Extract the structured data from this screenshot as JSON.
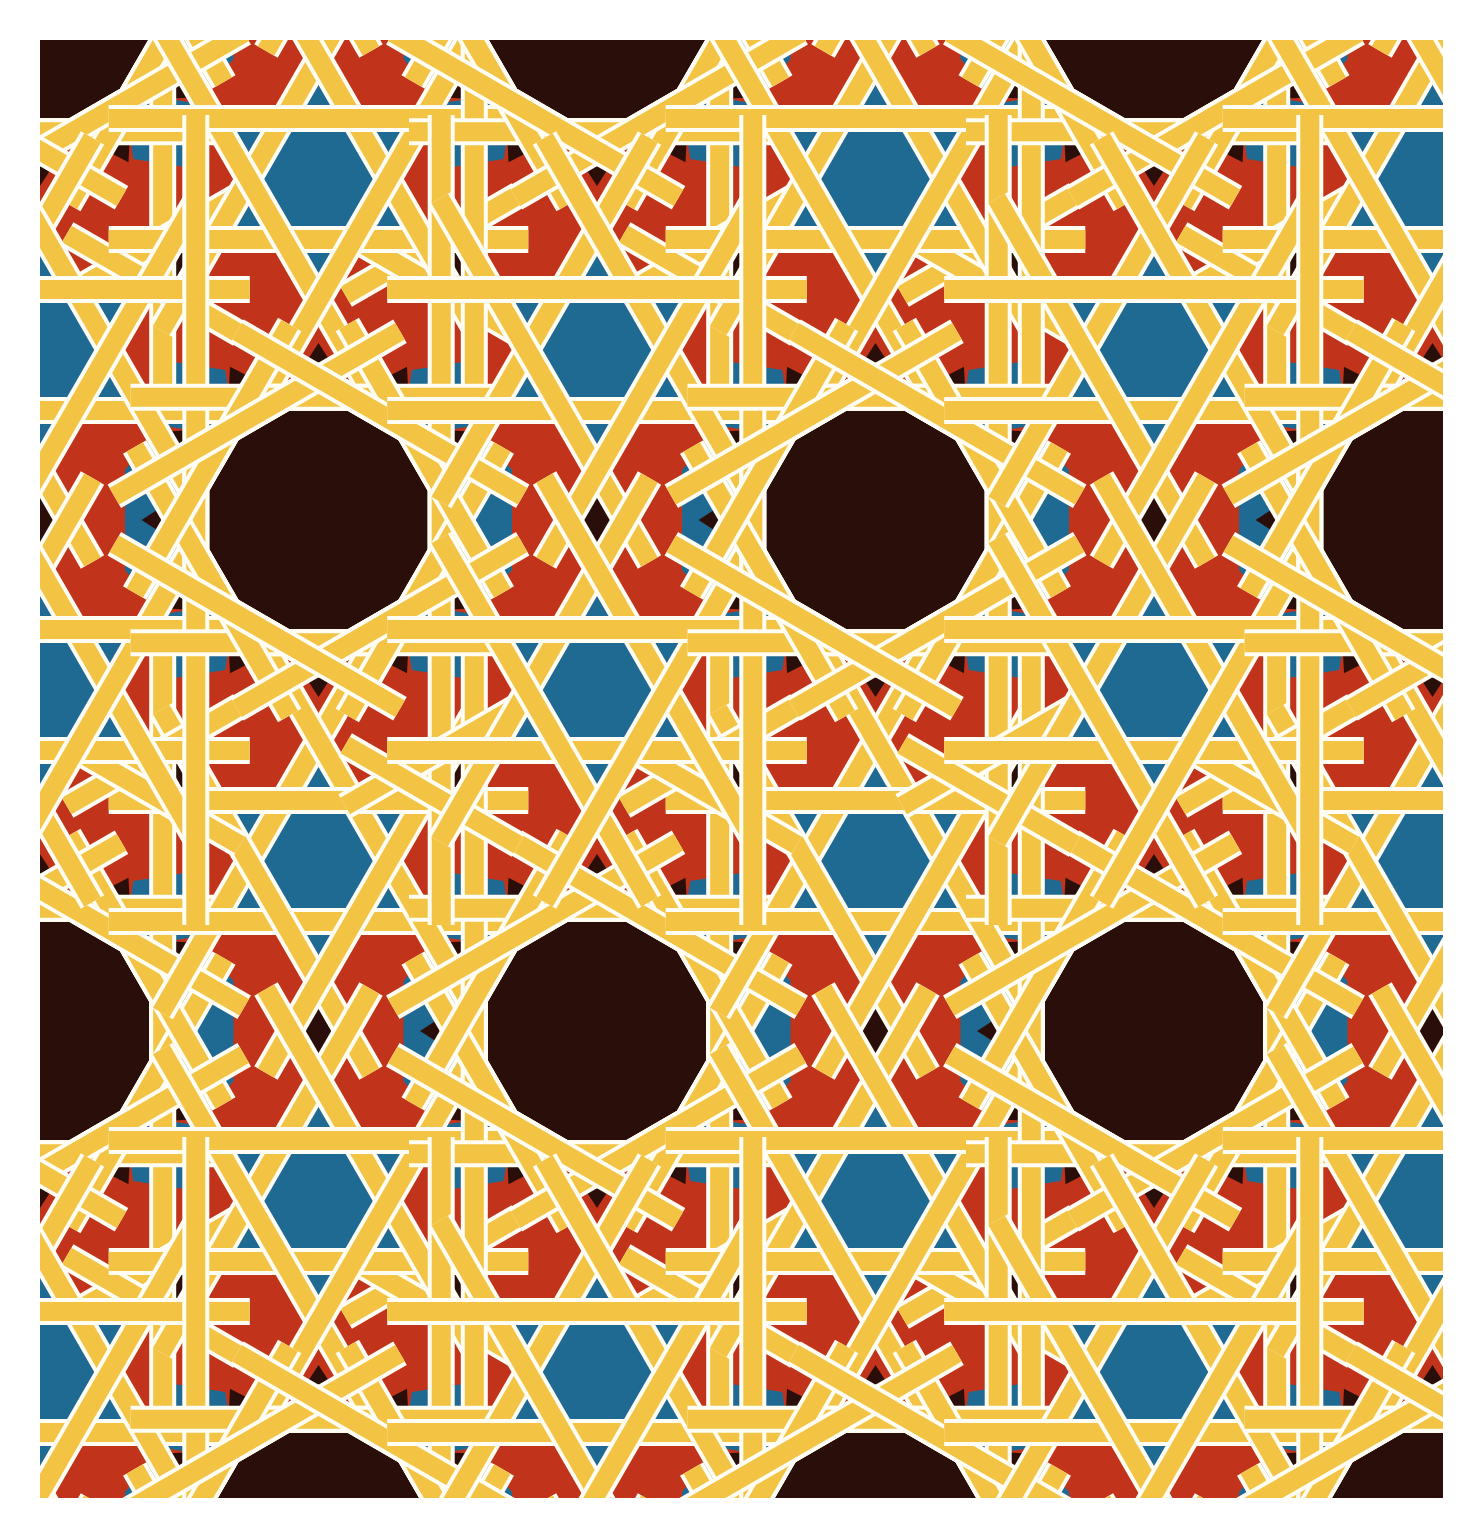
{
  "canvas": {
    "width": 1483,
    "height": 1538,
    "margin": 40
  },
  "colors": {
    "page_bg": "#ffffff",
    "field_red": "#c1331a",
    "blue": "#1e6a93",
    "dark": "#2a0e09",
    "band_fill": "#f3c443",
    "band_casing": "#fffdf4"
  },
  "geometry": {
    "tile_w": 557,
    "tile_h": 1022,
    "origin_x": 40,
    "origin_y": 9,
    "pair_dx": 278.5,
    "stamps": [
      [
        0,
        0
      ],
      [
        557,
        0
      ],
      [
        0,
        1022
      ],
      [
        557,
        1022
      ],
      [
        -278.5,
        511
      ],
      [
        278.5,
        511
      ]
    ],
    "star_gap": 170,
    "star_R": 121,
    "star_draw_R": 130,
    "star_notch_r": 70,
    "dodec_R": 127,
    "dodec_apothem": 122.7,
    "band_core_w": 19,
    "band_casing_w": 27,
    "vert_half": 405,
    "horiz_half": 188,
    "diag_steep_half": 155,
    "diag_shallow_half": 165,
    "edge_ext": 46,
    "tri_ext": 105,
    "flank_dx": 123,
    "flank_pts": [
      [
        0,
        -95
      ],
      [
        38,
        -50
      ],
      [
        38,
        50
      ],
      [
        0,
        95
      ],
      [
        -38,
        50
      ],
      [
        -38,
        -50
      ]
    ],
    "diamond_pts": [
      [
        44,
        0
      ],
      [
        13,
        13
      ],
      [
        0,
        49
      ],
      [
        -13,
        13
      ],
      [
        -44,
        0
      ],
      [
        -13,
        -13
      ],
      [
        0,
        -49
      ],
      [
        13,
        -13
      ]
    ],
    "mid_dx": 139.25,
    "mid_dy": 255.5,
    "mid_pts": [
      [
        26,
        0
      ],
      [
        9,
        9
      ],
      [
        0,
        33
      ],
      [
        -9,
        9
      ],
      [
        -26,
        0
      ],
      [
        -9,
        -9
      ],
      [
        0,
        -33
      ],
      [
        9,
        -9
      ]
    ],
    "pocket_r": 160,
    "pocket_pts": [
      [
        17,
        0
      ],
      [
        0,
        11
      ],
      [
        -17,
        0
      ],
      [
        0,
        -11
      ]
    ],
    "kite_r": 172,
    "kite_pts": [
      [
        -55,
        0
      ],
      [
        0,
        40
      ],
      [
        55,
        0
      ],
      [
        0,
        -40
      ]
    ],
    "kite_angles": [
      45,
      135,
      225,
      315
    ]
  }
}
